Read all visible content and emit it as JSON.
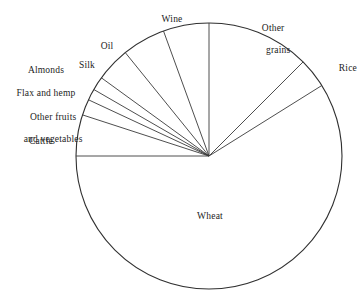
{
  "chart_data": {
    "type": "pie",
    "title": "",
    "subtitle": "",
    "xlabel": "",
    "ylabel": "",
    "legend_position": "none",
    "grid": false,
    "center": {
      "x": 209,
      "y": 156
    },
    "radius": 133,
    "start_angle_deg": 0,
    "direction": "clockwise",
    "stroke_color": "#303030",
    "fill_color": "#ffffff",
    "categories": [
      "Other grains",
      "Rice",
      "Wheat",
      "Cattle",
      "Other fruits and vegetables",
      "Flax and hemp",
      "Almonds",
      "Silk",
      "Oil",
      "Wine"
    ],
    "values": [
      12.5,
      3.6,
      58.9,
      5.0,
      1.9,
      1.4,
      1.7,
      4.2,
      5.3,
      5.5
    ],
    "slices": [
      {
        "label": "Other grains",
        "start_deg": 0,
        "end_deg": 45,
        "sweep_deg": 45,
        "percent": 12.5
      },
      {
        "label": "Rice",
        "start_deg": 45,
        "end_deg": 58,
        "sweep_deg": 13,
        "percent": 3.6
      },
      {
        "label": "Wheat",
        "start_deg": 58,
        "end_deg": 270,
        "sweep_deg": 212,
        "percent": 58.9
      },
      {
        "label": "Cattle",
        "start_deg": 270,
        "end_deg": 288,
        "sweep_deg": 18,
        "percent": 5.0
      },
      {
        "label": "Other fruits and vegetables",
        "start_deg": 288,
        "end_deg": 295,
        "sweep_deg": 7,
        "percent": 1.9
      },
      {
        "label": "Flax and hemp",
        "start_deg": 295,
        "end_deg": 300,
        "sweep_deg": 5,
        "percent": 1.4
      },
      {
        "label": "Almonds",
        "start_deg": 300,
        "end_deg": 306,
        "sweep_deg": 6,
        "percent": 1.7
      },
      {
        "label": "Silk",
        "start_deg": 306,
        "end_deg": 321,
        "sweep_deg": 15,
        "percent": 4.2
      },
      {
        "label": "Oil",
        "start_deg": 321,
        "end_deg": 340,
        "sweep_deg": 19,
        "percent": 5.3
      },
      {
        "label": "Wine",
        "start_deg": 340,
        "end_deg": 360,
        "sweep_deg": 20,
        "percent": 5.5
      }
    ],
    "labels": [
      {
        "text": "Wine",
        "x": 172,
        "y": 14,
        "align": "center"
      },
      {
        "text": "Other\ngrains",
        "x": 265,
        "y": 12,
        "align": "center"
      },
      {
        "text": "Rice",
        "x": 327,
        "y": 63,
        "align": "left"
      },
      {
        "text": "Oil",
        "x": 107,
        "y": 41,
        "align": "center"
      },
      {
        "text": "Silk",
        "x": 85,
        "y": 60,
        "align": "center"
      },
      {
        "text": "Almonds",
        "x": 46,
        "y": 65,
        "align": "center"
      },
      {
        "text": "Flax and hemp",
        "x": 45,
        "y": 88,
        "align": "center"
      },
      {
        "text": "Other fruits\nand vegetables",
        "x": 47,
        "y": 101,
        "align": "center"
      },
      {
        "text": "Cattle",
        "x": 41,
        "y": 136,
        "align": "center"
      },
      {
        "text": "Wheat",
        "x": 210,
        "y": 211,
        "align": "center"
      }
    ]
  },
  "labels": {
    "wine": "Wine",
    "other_grains_line1": "Other",
    "other_grains_line2": "grains",
    "rice": "Rice",
    "oil": "Oil",
    "silk": "Silk",
    "almonds": "Almonds",
    "flax_and_hemp": "Flax and hemp",
    "other_fruits_line1": "Other fruits",
    "other_fruits_line2": "and vegetables",
    "cattle": "Cattle",
    "wheat": "Wheat"
  }
}
